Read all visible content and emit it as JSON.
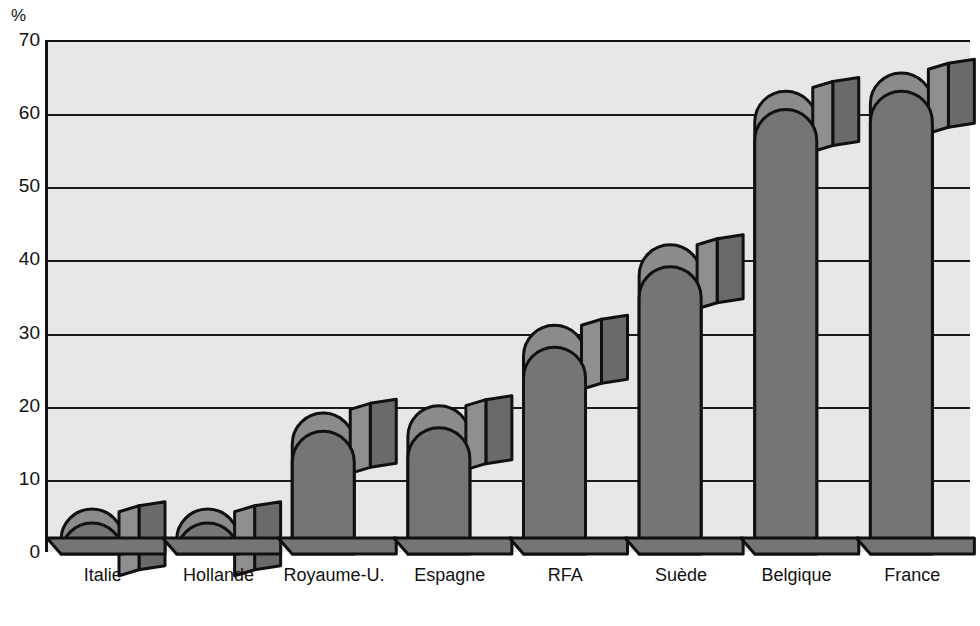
{
  "chart_data": {
    "type": "bar",
    "title": "",
    "subtitle": "",
    "xlabel": "",
    "ylabel": "%",
    "unit_label": "%",
    "ylim": [
      0,
      70
    ],
    "ytick_step": 10,
    "yticks": [
      "70",
      "60",
      "50",
      "40",
      "30",
      "20",
      "10",
      "0"
    ],
    "ytick_values": [
      70,
      60,
      50,
      40,
      30,
      20,
      10,
      0
    ],
    "grid": true,
    "grid_axis": "y",
    "legend": null,
    "legend_position": "none",
    "categories": [
      "Italie",
      "Hollande",
      "Royaume-U.",
      "Espagne",
      "RFA",
      "Suède",
      "Belgique",
      "France"
    ],
    "series": [
      {
        "name": "back",
        "values": [
          4,
          4,
          19,
          20,
          31,
          42,
          63,
          65.5
        ]
      },
      {
        "name": "front",
        "values": [
          2.5,
          2.5,
          16.5,
          17,
          28,
          39,
          60.5,
          63
        ]
      }
    ],
    "style": {
      "bar_shape": "arched-top-3d-extruded",
      "plot_background": "#e7e7e7",
      "bar_front_fill": "#757575",
      "bar_back_fill": "#8b8b8b",
      "bar_top_face_fill": "#8f8f8f",
      "bar_side_face_fill": "#6a6a6a",
      "outline_color": "#101010",
      "page_background": "#ffffff"
    }
  },
  "axis": {
    "unit": "%"
  }
}
